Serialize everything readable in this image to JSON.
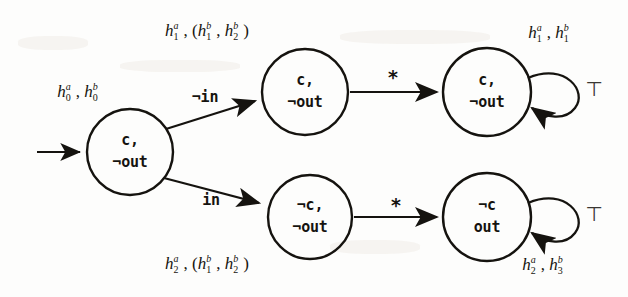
{
  "figure": {
    "type": "state-transition-diagram",
    "ink_color": "#15130f",
    "background_color": "#fdfdfc"
  },
  "states": [
    {
      "id": "s0",
      "name": "initial-state",
      "line1": "c,",
      "line2": "¬out",
      "cx": 130,
      "cy": 152,
      "r": 43
    },
    {
      "id": "s1",
      "name": "upper-middle-state",
      "line1": "c,",
      "line2": "¬out",
      "cx": 305,
      "cy": 92,
      "r": 43
    },
    {
      "id": "s2",
      "name": "lower-middle-state",
      "line1": "¬c,",
      "line2": "¬out",
      "cx": 310,
      "cy": 217,
      "r": 42
    },
    {
      "id": "s3",
      "name": "upper-right-state",
      "line1": "c,",
      "line2": "¬out",
      "cx": 487,
      "cy": 92,
      "r": 44
    },
    {
      "id": "s4",
      "name": "lower-right-state",
      "line1": "¬c",
      "line2": "out",
      "cx": 487,
      "cy": 217,
      "r": 44
    }
  ],
  "edge_labels": {
    "not_in": "¬in",
    "in": "in",
    "star_upper": "*",
    "star_lower": "*",
    "loop_upper": "⊤",
    "loop_lower": "⊤"
  },
  "annotations": [
    {
      "id": "a0",
      "name": "initial-state-annotation",
      "h1": "h",
      "sup1": "a",
      "sub1": "0",
      "sep": ", ",
      "h2": "h",
      "sup2": "b",
      "sub2": "0",
      "text": "h₀ᵃ, h₀ᵇ",
      "x": 80,
      "y": 92
    },
    {
      "id": "a1",
      "name": "upper-branch-annotation",
      "text": "h₁ᵃ, (h₁ᵇ, h₂ᵇ)",
      "x": 205,
      "y": 31
    },
    {
      "id": "a2",
      "name": "lower-branch-annotation",
      "text": "h₂ᵃ, (h₁ᵇ, h₂ᵇ)",
      "x": 205,
      "y": 264
    },
    {
      "id": "a3",
      "name": "upper-right-annotation",
      "text": "h₁ᵃ, h₁ᵇ",
      "x": 551,
      "y": 33
    },
    {
      "id": "a4",
      "name": "lower-right-annotation",
      "text": "h₂ᵃ, h₃ᵇ",
      "x": 545,
      "y": 265
    }
  ],
  "annotation_parts": {
    "a0": {
      "p1": "h",
      "s1": "a",
      "b1": "0",
      "comma": ",",
      "p2": "h",
      "s2": "b",
      "b2": "0"
    },
    "a1": {
      "p1": "h",
      "s1": "a",
      "b1": "1",
      "open": ", (",
      "p2": "h",
      "s2": "b",
      "b2": "1",
      "comma": ", ",
      "p3": "h",
      "s3": "b",
      "b3": "2",
      "close": ")"
    },
    "a2": {
      "p1": "h",
      "s1": "a",
      "b1": "2",
      "open": ", (",
      "p2": "h",
      "s2": "b",
      "b2": "1",
      "comma": ", ",
      "p3": "h",
      "s3": "b",
      "b3": "2",
      "close": ")"
    },
    "a3": {
      "p1": "h",
      "s1": "a",
      "b1": "1",
      "comma": ", ",
      "p2": "h",
      "s2": "b",
      "b2": "1"
    },
    "a4": {
      "p1": "h",
      "s1": "a",
      "b1": "2",
      "comma": ", ",
      "p2": "h",
      "s2": "b",
      "b2": "3"
    }
  }
}
